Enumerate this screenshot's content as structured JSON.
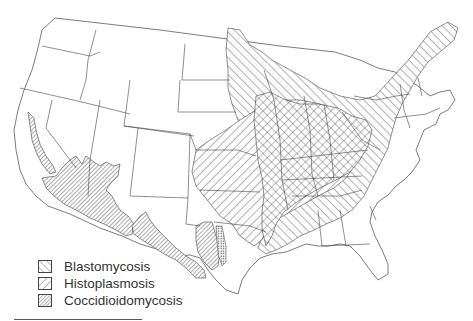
{
  "figure": {
    "type": "map",
    "region": "Contiguous United States",
    "style": "black-and-white hatched regions over state outlines"
  },
  "legend": {
    "items": [
      {
        "label": "Blastomycosis",
        "pattern": "diagonal-up-right hatch",
        "icon": "hatch-forward-icon"
      },
      {
        "label": "Histoplasmosis",
        "pattern": "diagonal-down-right hatch",
        "icon": "hatch-back-icon"
      },
      {
        "label": "Coccidioidomycosis",
        "pattern": "dense diagonal-down-right hatch",
        "icon": "hatch-dense-icon"
      }
    ]
  },
  "regions": [
    {
      "name": "Blastomycosis",
      "extent": "Great Lakes, upper Midwest, St. Lawrence valley to northern New England, Ohio & Mississippi valleys, Southeast"
    },
    {
      "name": "Histoplasmosis",
      "extent": "Central Mississippi and Ohio River valleys, Great Plains"
    },
    {
      "name": "Overlap (Blastomycosis + Histoplasmosis)",
      "extent": "Ohio/Mississippi valley states (cross-hatched)"
    },
    {
      "name": "Coccidioidomycosis",
      "extent": "Central California valley, southern Arizona, southern New Mexico, West Texas"
    }
  ],
  "colors": {
    "stroke": "#444444",
    "background": "#ffffff"
  }
}
